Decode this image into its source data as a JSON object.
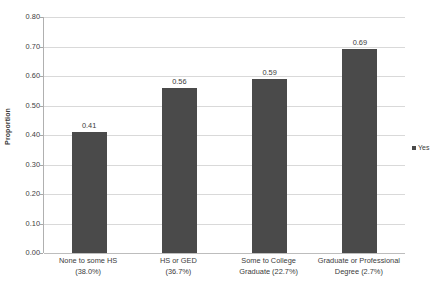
{
  "chart_data": {
    "type": "bar",
    "title": "",
    "subtitle": "",
    "xlabel": "",
    "ylabel": "Proportion",
    "ylim": [
      0.0,
      0.8
    ],
    "ytick_step": 0.1,
    "grid": true,
    "legend_position": "right",
    "categories": [
      "None to some HS\n(38.0%)",
      "HS or GED\n(36.7%)",
      "Some to College\nGraduate (22.7%)",
      "Graduate or Professional\nDegree (2.7%)"
    ],
    "category_lines": [
      [
        "None to some HS",
        "(38.0%)"
      ],
      [
        "HS or GED",
        "(36.7%)"
      ],
      [
        "Some to College",
        "Graduate (22.7%)"
      ],
      [
        "Graduate or Professional",
        "Degree (2.7%)"
      ]
    ],
    "values": [
      0.41,
      0.56,
      0.59,
      0.69
    ],
    "value_labels": [
      "0.41",
      "0.56",
      "0.59",
      "0.69"
    ],
    "ytick_labels": [
      "0.80",
      "0.70",
      "0.60",
      "0.50",
      "0.40",
      "0.30",
      "0.20",
      "0.10",
      "0.00"
    ],
    "ytick_values": [
      0.8,
      0.7,
      0.6,
      0.5,
      0.4,
      0.3,
      0.2,
      0.1,
      0.0
    ],
    "series": [
      {
        "name": "Yes",
        "color": "#4a4a4a",
        "values": [
          0.41,
          0.56,
          0.59,
          0.69
        ]
      }
    ],
    "legend": [
      {
        "label": "Yes",
        "color": "#4a4a4a",
        "marker": "square"
      }
    ],
    "colors": {
      "bar": "#4a4a4a",
      "gridline": "#d9d9d9",
      "axis": "#b0b0b0",
      "text": "#3b3b3b",
      "background": "#ffffff"
    }
  }
}
